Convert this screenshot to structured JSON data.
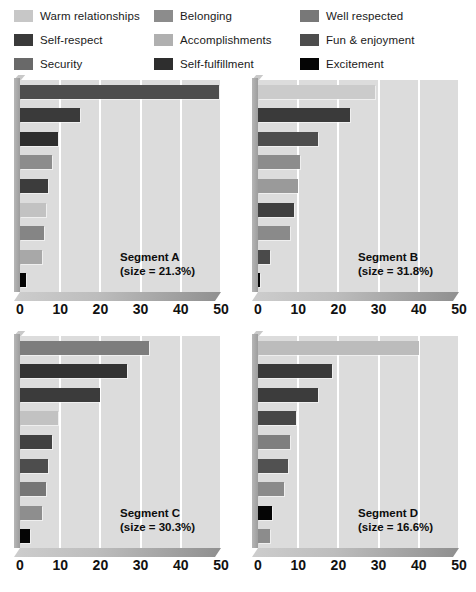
{
  "legend": {
    "items": [
      {
        "label": "Warm relationships",
        "color": "#c7c7c7",
        "icon": "color-swatch"
      },
      {
        "label": "Belonging",
        "color": "#8c8c8c",
        "icon": "color-swatch"
      },
      {
        "label": "Well respected",
        "color": "#787878",
        "icon": "color-swatch"
      },
      {
        "label": "Self-respect",
        "color": "#3a3a3a",
        "icon": "color-swatch"
      },
      {
        "label": "Accomplishments",
        "color": "#b0b0b0",
        "icon": "color-swatch"
      },
      {
        "label": "Fun & enjoyment",
        "color": "#4d4d4d",
        "icon": "color-swatch"
      },
      {
        "label": "Security",
        "color": "#696969",
        "icon": "color-swatch"
      },
      {
        "label": "Self-fulfillment",
        "color": "#2e2e2e",
        "icon": "color-swatch"
      },
      {
        "label": "Excitement",
        "color": "#050505",
        "icon": "color-swatch"
      }
    ]
  },
  "chart_data": {
    "type": "bar",
    "orientation": "horizontal",
    "title": "",
    "xlabel": "",
    "ylabel": "",
    "xlim": [
      0,
      50
    ],
    "xticks": [
      0,
      10,
      20,
      30,
      40,
      50
    ],
    "xtick_labels": [
      "0",
      "10",
      "20",
      "30",
      "40",
      "50"
    ],
    "grid": true,
    "gridlines_at": [
      10,
      20,
      30,
      40,
      50
    ],
    "legend_position": "top",
    "categories": [
      "Warm relationships",
      "Belonging",
      "Well respected",
      "Self-respect",
      "Accomplishments",
      "Fun & enjoyment",
      "Security",
      "Self-fulfillment",
      "Excitement"
    ],
    "panels": [
      {
        "id": "segment-a",
        "name": "Segment A",
        "size_label": "(size = 21.3%)",
        "size_percent": 21.3,
        "bars": [
          {
            "category": "Fun & enjoyment",
            "value": 49.5,
            "color": "#4d4d4d"
          },
          {
            "category": "Self-respect",
            "value": 15.0,
            "color": "#3a3a3a"
          },
          {
            "category": "Self-fulfillment",
            "value": 9.5,
            "color": "#2e2e2e"
          },
          {
            "category": "Belonging",
            "value": 8.0,
            "color": "#8c8c8c"
          },
          {
            "category": "Security",
            "value": 7.0,
            "color": "#3c3c3c"
          },
          {
            "category": "Warm relationships",
            "value": 6.5,
            "color": "#c2c2c2"
          },
          {
            "category": "Well respected",
            "value": 6.0,
            "color": "#858585"
          },
          {
            "category": "Accomplishments",
            "value": 5.5,
            "color": "#a8a8a8"
          },
          {
            "category": "Excitement",
            "value": 1.5,
            "color": "#050505"
          }
        ]
      },
      {
        "id": "segment-b",
        "name": "Segment B",
        "size_label": "(size = 31.8%)",
        "size_percent": 31.8,
        "bars": [
          {
            "category": "Warm relationships",
            "value": 29.0,
            "color": "#cbcbcb"
          },
          {
            "category": "Self-respect",
            "value": 23.0,
            "color": "#3a3a3a"
          },
          {
            "category": "Fun & enjoyment",
            "value": 15.0,
            "color": "#4d4d4d"
          },
          {
            "category": "Belonging",
            "value": 10.5,
            "color": "#8c8c8c"
          },
          {
            "category": "Accomplishments",
            "value": 10.0,
            "color": "#9a9a9a"
          },
          {
            "category": "Self-fulfillment",
            "value": 9.0,
            "color": "#3f3f3f"
          },
          {
            "category": "Well respected",
            "value": 8.0,
            "color": "#8a8a8a"
          },
          {
            "category": "Security",
            "value": 3.0,
            "color": "#4a4a4a"
          },
          {
            "category": "Excitement",
            "value": 0.6,
            "color": "#050505"
          }
        ]
      },
      {
        "id": "segment-c",
        "name": "Segment C",
        "size_label": "(size = 30.3%)",
        "size_percent": 30.3,
        "bars": [
          {
            "category": "Well respected",
            "value": 32.0,
            "color": "#7d7d7d"
          },
          {
            "category": "Self-respect",
            "value": 26.5,
            "color": "#333333"
          },
          {
            "category": "Self-fulfillment",
            "value": 20.0,
            "color": "#3b3b3b"
          },
          {
            "category": "Warm relationships",
            "value": 9.5,
            "color": "#c2c2c2"
          },
          {
            "category": "Fun & enjoyment",
            "value": 8.0,
            "color": "#414141"
          },
          {
            "category": "Security",
            "value": 7.0,
            "color": "#4d4d4d"
          },
          {
            "category": "Belonging",
            "value": 6.5,
            "color": "#767676"
          },
          {
            "category": "Accomplishments",
            "value": 5.5,
            "color": "#8e8e8e"
          },
          {
            "category": "Excitement",
            "value": 2.5,
            "color": "#050505"
          }
        ]
      },
      {
        "id": "segment-d",
        "name": "Segment D",
        "size_label": "(size = 16.6%)",
        "size_percent": 16.6,
        "bars": [
          {
            "category": "Warm relationships",
            "value": 40.0,
            "color": "#bcbcbc"
          },
          {
            "category": "Self-respect",
            "value": 18.5,
            "color": "#3a3a3a"
          },
          {
            "category": "Fun & enjoyment",
            "value": 15.0,
            "color": "#3c3c3c"
          },
          {
            "category": "Self-fulfillment",
            "value": 9.5,
            "color": "#474747"
          },
          {
            "category": "Belonging",
            "value": 8.0,
            "color": "#7f7f7f"
          },
          {
            "category": "Security",
            "value": 7.5,
            "color": "#515151"
          },
          {
            "category": "Accomplishments",
            "value": 6.5,
            "color": "#8a8a8a"
          },
          {
            "category": "Excitement",
            "value": 3.5,
            "color": "#050505"
          },
          {
            "category": "Well respected",
            "value": 3.0,
            "color": "#8c8c8c"
          }
        ]
      }
    ]
  }
}
